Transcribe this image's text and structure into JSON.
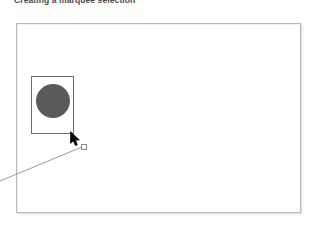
{
  "caption": {
    "text": "Creating a marquee selection"
  },
  "canvas": {
    "name": "document-canvas",
    "background_color": "#ffffff",
    "border_color": "#b9b9b9"
  },
  "selection": {
    "tool": "marquee",
    "rect_label": "marquee-selection-rectangle",
    "rect_border_color": "#6e6e6e",
    "handle_label": "marquee-drag-handle",
    "handle_fill": "#ffffff",
    "handle_border": "#8a8a8a"
  },
  "shape": {
    "type": "circle",
    "label": "selected-circle-object",
    "fill_color": "#5a5a5a"
  },
  "cursor": {
    "type": "arrow-pointer",
    "color": "#000000"
  },
  "annotation": {
    "leader_line_label": "callout-leader-line",
    "color": "#9a9a9a"
  }
}
